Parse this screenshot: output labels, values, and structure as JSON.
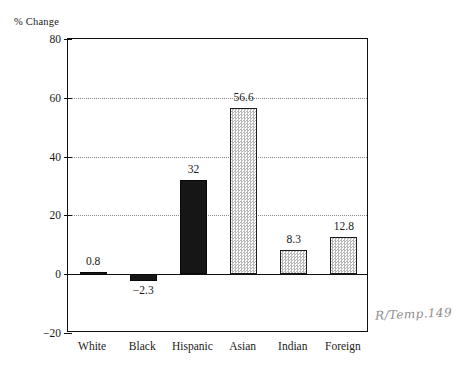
{
  "chart_data": {
    "type": "bar",
    "title": "",
    "subtitle": "",
    "xlabel": "",
    "ylabel": "% Change",
    "categories": [
      "White",
      "Black",
      "Hispanic",
      "Asian",
      "Indian",
      "Foreign"
    ],
    "values": [
      0.8,
      -2.3,
      32,
      56.6,
      8.3,
      12.8
    ],
    "value_labels": [
      "0.8",
      "−2.3",
      "32",
      "56.6",
      "8.3",
      "12.8"
    ],
    "series": [
      {
        "name": "% Change",
        "values": [
          0.8,
          -2.3,
          32,
          56.6,
          8.3,
          12.8
        ]
      }
    ],
    "bar_styles": [
      "solid-black",
      "solid-black",
      "solid-black",
      "gray-stipple",
      "gray-stipple",
      "gray-stipple"
    ],
    "ylim": [
      -20,
      80
    ],
    "yticks": [
      80,
      60,
      40,
      20,
      0,
      -20
    ],
    "ytick_labels": [
      "80",
      "60",
      "40",
      "20",
      "0",
      "−20"
    ],
    "grid": "horizontal-dotted",
    "legend": "none",
    "annotations": [
      {
        "name": "handwritten-reference-note",
        "text": "R/Temp.149"
      }
    ],
    "colors": {
      "axis": "#101010",
      "grid": "#8a8a8a",
      "bar_solid": "#161616",
      "bar_stipple": "#b9b9b9",
      "background": "#ffffff",
      "annotation": "#8d8d8d"
    }
  }
}
